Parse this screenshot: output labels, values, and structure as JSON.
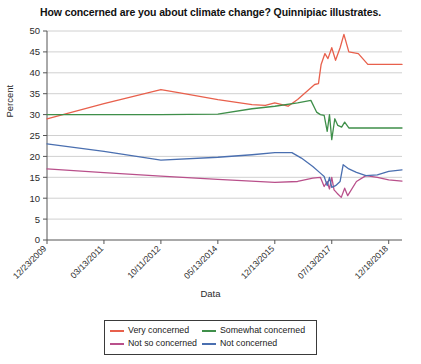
{
  "chart_data": {
    "type": "line",
    "title": "How concerned are you about climate change? Quinnipiac illustrates.",
    "xlabel": "Data",
    "ylabel": "Percent",
    "ylim": [
      0,
      50
    ],
    "ytick_labels": [
      "0",
      "5",
      "10",
      "15",
      "20",
      "25",
      "30",
      "35",
      "40",
      "45",
      "50"
    ],
    "ytick_values": [
      0,
      5,
      10,
      15,
      20,
      25,
      30,
      35,
      40,
      45,
      50
    ],
    "xtick_labels": [
      "12/23/2009",
      "03/13/2011",
      "10/11/2012",
      "05/13/2014",
      "12/13/2015",
      "07/13/2017",
      "12/18/2018"
    ],
    "xtick_positions": [
      0,
      1.5,
      3,
      4.5,
      6,
      7.5,
      9
    ],
    "xlim": [
      0,
      9.35
    ],
    "grid": "horizontal",
    "legend_position": "bottom",
    "series": [
      {
        "name": "Very concerned",
        "color": "#e8604c",
        "points": [
          [
            0.0,
            29.0
          ],
          [
            1.5,
            32.6
          ],
          [
            3.0,
            36.0
          ],
          [
            3.5,
            35.2
          ],
          [
            4.5,
            33.6
          ],
          [
            5.4,
            32.4
          ],
          [
            5.75,
            32.2
          ],
          [
            6.0,
            32.8
          ],
          [
            6.35,
            32.0
          ],
          [
            6.6,
            33.6
          ],
          [
            6.9,
            36.0
          ],
          [
            7.05,
            37.2
          ],
          [
            7.15,
            37.4
          ],
          [
            7.22,
            42.0
          ],
          [
            7.32,
            44.6
          ],
          [
            7.4,
            43.4
          ],
          [
            7.5,
            46.0
          ],
          [
            7.6,
            43.0
          ],
          [
            7.72,
            46.0
          ],
          [
            7.82,
            49.2
          ],
          [
            7.95,
            45.0
          ],
          [
            8.2,
            44.6
          ],
          [
            8.45,
            42.0
          ],
          [
            9.0,
            42.0
          ],
          [
            9.35,
            42.0
          ]
        ]
      },
      {
        "name": "Somewhat concerned",
        "color": "#3f8f4a",
        "points": [
          [
            0.0,
            30.0
          ],
          [
            1.5,
            30.0
          ],
          [
            3.0,
            30.0
          ],
          [
            4.5,
            30.1
          ],
          [
            5.4,
            31.4
          ],
          [
            6.0,
            32.0
          ],
          [
            6.6,
            32.8
          ],
          [
            6.95,
            33.4
          ],
          [
            7.1,
            30.6
          ],
          [
            7.2,
            30.0
          ],
          [
            7.3,
            29.8
          ],
          [
            7.38,
            26.0
          ],
          [
            7.44,
            30.0
          ],
          [
            7.5,
            24.0
          ],
          [
            7.58,
            29.0
          ],
          [
            7.66,
            27.4
          ],
          [
            7.76,
            27.0
          ],
          [
            7.84,
            28.2
          ],
          [
            7.95,
            26.8
          ],
          [
            8.3,
            26.8
          ],
          [
            9.0,
            26.8
          ],
          [
            9.35,
            26.8
          ]
        ]
      },
      {
        "name": "Not so concerned",
        "color": "#b9508b",
        "points": [
          [
            0.0,
            17.0
          ],
          [
            1.5,
            16.1
          ],
          [
            3.0,
            15.3
          ],
          [
            4.5,
            14.5
          ],
          [
            6.0,
            13.8
          ],
          [
            6.6,
            14.0
          ],
          [
            7.0,
            14.8
          ],
          [
            7.2,
            15.0
          ],
          [
            7.3,
            12.8
          ],
          [
            7.38,
            14.0
          ],
          [
            7.44,
            12.2
          ],
          [
            7.5,
            15.0
          ],
          [
            7.56,
            12.0
          ],
          [
            7.64,
            11.2
          ],
          [
            7.75,
            10.2
          ],
          [
            7.84,
            12.4
          ],
          [
            7.92,
            10.6
          ],
          [
            8.15,
            14.0
          ],
          [
            8.4,
            15.4
          ],
          [
            8.7,
            15.0
          ],
          [
            9.0,
            14.4
          ],
          [
            9.35,
            14.1
          ]
        ]
      },
      {
        "name": "Not concerned",
        "color": "#4a6fb0",
        "points": [
          [
            0.0,
            23.0
          ],
          [
            1.5,
            21.2
          ],
          [
            3.0,
            19.1
          ],
          [
            4.5,
            19.8
          ],
          [
            5.4,
            20.4
          ],
          [
            6.0,
            20.9
          ],
          [
            6.45,
            20.9
          ],
          [
            6.7,
            19.6
          ],
          [
            7.0,
            17.6
          ],
          [
            7.2,
            16.0
          ],
          [
            7.3,
            15.2
          ],
          [
            7.38,
            13.0
          ],
          [
            7.44,
            15.0
          ],
          [
            7.5,
            12.6
          ],
          [
            7.6,
            13.0
          ],
          [
            7.72,
            14.0
          ],
          [
            7.8,
            18.0
          ],
          [
            7.95,
            17.0
          ],
          [
            8.15,
            16.2
          ],
          [
            8.4,
            15.4
          ],
          [
            8.7,
            15.6
          ],
          [
            9.0,
            16.4
          ],
          [
            9.35,
            16.8
          ]
        ]
      }
    ]
  },
  "legend": {
    "entries": [
      {
        "label": "Very concerned"
      },
      {
        "label": "Somewhat concerned"
      },
      {
        "label": "Not so concerned"
      },
      {
        "label": "Not concerned"
      }
    ]
  }
}
